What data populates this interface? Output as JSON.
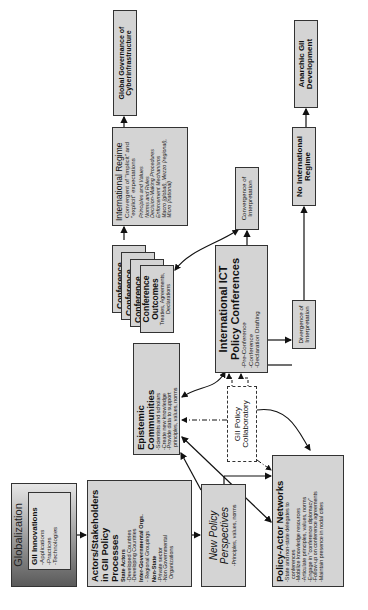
{
  "globalization": {
    "title": "Globalization",
    "inner_title": "GII Innovations",
    "items": [
      "-Applications",
      "-Practices",
      "-Technologies"
    ]
  },
  "actors": {
    "title_line1": "Actors/Stakeholders",
    "title_line2": "in GII Policy Processes",
    "groups": [
      {
        "label": "State Actors",
        "items": [
          "-Developed Countries",
          "-Developing Countries"
        ]
      },
      {
        "label": "Inter-Governmental Orgs.",
        "items": [
          "- Regional Groupings"
        ]
      },
      {
        "label": "Non-State",
        "items": [
          "-Private sector",
          "-Non Governmental",
          "Organizations"
        ]
      }
    ]
  },
  "new_policy": {
    "title_line1": "New Policy",
    "title_line2": "Perspectives",
    "items": [
      "-Principles, values, norms"
    ]
  },
  "policy_actor": {
    "title": "Policy-Actor Networks",
    "items": [
      "-State and non-state delegates to",
      "conferences",
      "-Mobilize knowledge resources",
      "-Articulate principles, values, norms",
      "-Engage in \"conference diplomacy\"",
      "-Follow-up on conference agreements",
      "-Maintain presence in nodal cities"
    ]
  },
  "epistemic": {
    "title": "Epistemic Communities",
    "items": [
      "-Scientists and scholars",
      "-Create new knowledge",
      "-Provide data to support",
      "principles, values, norms"
    ]
  },
  "collaboratory": {
    "title_line1": "GII Policy",
    "title_line2": "Collaboratory"
  },
  "ict_conferences": {
    "title_line1": "International ICT",
    "title_line2": "Policy Conferences",
    "items": [
      "-Pre-Conference",
      "-Conference",
      "-Declaration Drafting"
    ]
  },
  "outcomes": {
    "stack_label": "Conference",
    "title_line1": "Conference",
    "title_line2": "Outcomes",
    "items": [
      "Treaties, Agreements,",
      "Declarations"
    ]
  },
  "convergence": {
    "line1": "Convergence of",
    "line2": "Interpretation"
  },
  "divergence": {
    "line1": "Divergence of",
    "line2": "Interpretation"
  },
  "regime": {
    "title": "International Regime",
    "subtitle_line1": "Convergent of \"implicit\" and",
    "subtitle_line2": "\"explicit\" expectations",
    "items": [
      "Principles and Values",
      "Norms and Rules",
      "Decision-Making Procedures",
      "Enforcement Mechanisms",
      "Macro (global), Mezzo (regional),",
      "Micro (national)"
    ]
  },
  "global_governance": {
    "line1": "Global Governance of",
    "line2": "Cyberinfrastructure"
  },
  "no_regime": {
    "line1": "No International",
    "line2": "Regime"
  },
  "anarchic": {
    "line1": "Anarchic GII",
    "line2": "Development"
  }
}
